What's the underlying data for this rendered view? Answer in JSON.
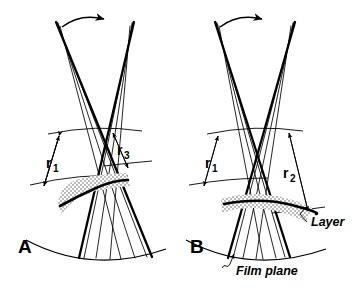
{
  "figure": {
    "domain": "diagram",
    "background_color": "#ffffff",
    "ink_color": "#000000",
    "width": 357,
    "height": 288
  },
  "panels": [
    {
      "id": "A",
      "letter": "A",
      "rotation_arrow": "curved-arrow-right",
      "dimensions": [
        {
          "id": "r1",
          "base": "r",
          "subscript": "1"
        },
        {
          "id": "r3",
          "base": "r",
          "subscript": "3"
        }
      ],
      "layer": {
        "style": "stippled-band",
        "curve": "steep-inclined-arc"
      }
    },
    {
      "id": "B",
      "letter": "B",
      "rotation_arrow": "curved-arrow-right",
      "dimensions": [
        {
          "id": "r1",
          "base": "r",
          "subscript": "1"
        },
        {
          "id": "r2",
          "base": "r",
          "subscript": "2"
        }
      ],
      "layer": {
        "style": "stippled-band",
        "curve": "shallow-arc"
      }
    }
  ],
  "annotations": {
    "layer_label": "Layer",
    "film_plane_label": "Film plane"
  }
}
